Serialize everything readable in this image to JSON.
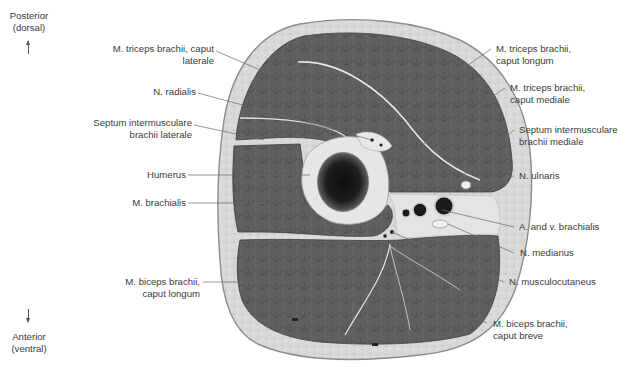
{
  "figure": {
    "colors": {
      "background": "#ffffff",
      "skin_subcutis": "#d9d9d9",
      "skin_outline": "#8c8c8c",
      "muscle": "#5e5e5e",
      "muscle_dark": "#4a4a4a",
      "fascia": "#e8e8e8",
      "bone_cortex": "#e6e6e6",
      "marrow": "#1a1a1a",
      "leader_line": "#6a6a6a",
      "label_text": "#3b3b3b"
    }
  },
  "orientation": {
    "top": {
      "line1": "Posterior",
      "line2": "(dorsal)",
      "arrow": "up-arrow"
    },
    "bottom": {
      "line1": "Anterior",
      "line2": "(ventral)",
      "arrow": "down-arrow"
    }
  },
  "labels_left": [
    {
      "id": "triceps-lateral",
      "lines": [
        "M. triceps brachii, caput",
        "laterale"
      ]
    },
    {
      "id": "n-radialis",
      "lines": [
        "N. radialis"
      ]
    },
    {
      "id": "septum-lateral",
      "lines": [
        "Septum intermusculare",
        "brachii laterale"
      ]
    },
    {
      "id": "humerus",
      "lines": [
        "Humerus"
      ]
    },
    {
      "id": "brachialis",
      "lines": [
        "M. brachialis"
      ]
    },
    {
      "id": "biceps-longum",
      "lines": [
        "M. biceps brachii,",
        "caput longum"
      ]
    }
  ],
  "labels_right": [
    {
      "id": "triceps-longum",
      "lines": [
        "M. triceps brachii,",
        "caput longum"
      ]
    },
    {
      "id": "triceps-mediale",
      "lines": [
        "M. triceps brachii,",
        "caput mediale"
      ]
    },
    {
      "id": "septum-medial",
      "lines": [
        "Septum intermusculare",
        "brachii mediale"
      ]
    },
    {
      "id": "n-ulnaris",
      "lines": [
        "N. ulnaris"
      ]
    },
    {
      "id": "a-v-brachialis",
      "lines": [
        "A. and v. brachialis"
      ]
    },
    {
      "id": "n-medianus",
      "lines": [
        "N. medianus"
      ]
    },
    {
      "id": "n-musculocutaneus",
      "lines": [
        "N. musculocutaneus"
      ]
    },
    {
      "id": "biceps-breve",
      "lines": [
        "M. biceps brachii,",
        "caput breve"
      ]
    }
  ]
}
